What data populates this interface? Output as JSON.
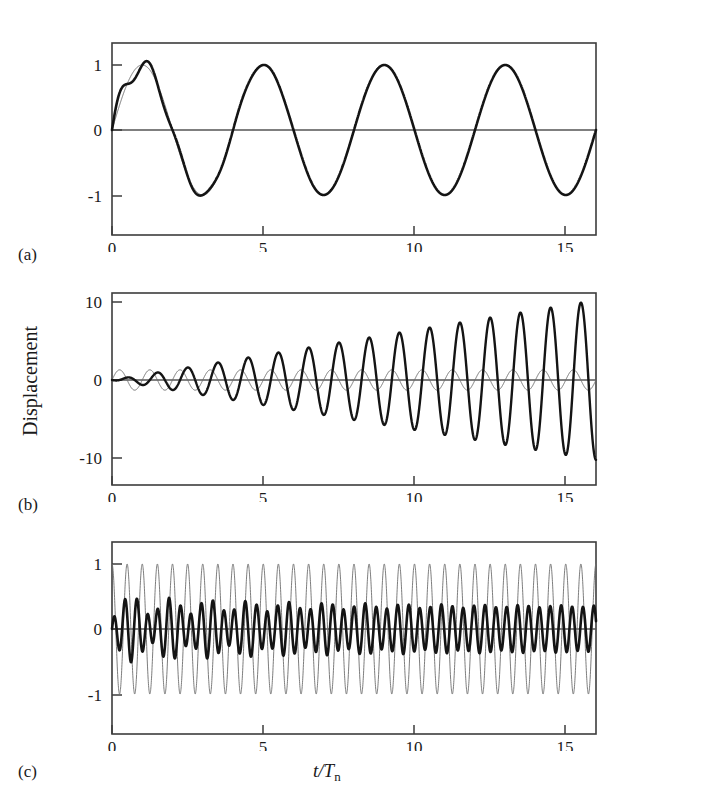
{
  "figure": {
    "ylabel": "Displacement",
    "xlabel_main": "t/T",
    "xlabel_sub": "n",
    "background": "#ffffff",
    "thick_color": "#141414",
    "thin_color": "#6e6e6e",
    "frame_color": "#3c3c3c"
  },
  "panels": [
    {
      "tag": "(a)",
      "x_ticks": [
        "0",
        "5",
        "10",
        "15"
      ],
      "y_ticks": [
        "1",
        "0",
        "-1"
      ]
    },
    {
      "tag": "(b)",
      "x_ticks": [
        "0",
        "5",
        "10",
        "15"
      ],
      "y_ticks": [
        "10",
        "0",
        "-10"
      ]
    },
    {
      "tag": "(c)",
      "x_ticks": [
        "0",
        "5",
        "10",
        "15"
      ],
      "y_ticks": [
        "1",
        "0",
        "-1"
      ]
    }
  ],
  "chart_data": [
    {
      "type": "line",
      "title": "(a) Response for forcing frequency well below natural frequency",
      "xlabel": "t/T_n",
      "ylabel": "Displacement",
      "xlim": [
        0,
        16
      ],
      "ylim": [
        -1.35,
        1.35
      ],
      "xticks": [
        0,
        5,
        10,
        15
      ],
      "yticks": [
        -1,
        0,
        1
      ],
      "grid": false,
      "legend": "none",
      "series": [
        {
          "name": "total response (thick)",
          "style": "thick-black",
          "model": "steady_plus_transient",
          "amplitude": 1.0,
          "forcing_period": 4.0,
          "transient_period": 1.0,
          "transient_amplitude": 0.22,
          "transient_decay_time": 1.6,
          "description": "Forced sinusoid of amplitude ~1 and period 4 t/Tn, with a decaying transient ripple at the natural period visible only during the first ~2 t/Tn; first peak overshoots to ~1.2."
        },
        {
          "name": "steady-state response (thin)",
          "style": "thin-gray",
          "model": "pure_sine",
          "amplitude": 1.0,
          "period": 4.0,
          "phase": 0.0,
          "description": "Smooth sinusoid, amplitude 1.0, period 4 t/Tn, zero at t=0 rising."
        }
      ],
      "annotations": [
        "peaks near t/Tn = 1, 5, 9, 13",
        "troughs near t/Tn = 3, 7, 11, 15"
      ]
    },
    {
      "type": "line",
      "title": "(b) Resonance: forcing frequency equals natural frequency",
      "xlabel": "t/T_n",
      "ylabel": "Displacement",
      "xlim": [
        0,
        16
      ],
      "ylim": [
        -13,
        13
      ],
      "xticks": [
        0,
        5,
        10,
        15
      ],
      "yticks": [
        -10,
        0,
        10
      ],
      "grid": false,
      "legend": "none",
      "series": [
        {
          "name": "resonant response (thick)",
          "style": "thick-black",
          "model": "linear_growing_envelope",
          "period": 1.0,
          "envelope_slope_per_unit": 0.64,
          "envelope_at_t16": 10.3,
          "description": "Oscillation at period 1 t/Tn whose amplitude grows almost linearly from 0 to about 10 at t/Tn = 16."
        },
        {
          "name": "forcing / static response (thin)",
          "style": "thin-gray",
          "model": "pure_sine",
          "amplitude": 1.3,
          "period": 1.0,
          "phase": 0.0,
          "description": "Small constant-amplitude sinusoid of amplitude ~1.3, period 1 t/Tn, in quadrature with the growing response."
        }
      ],
      "annotations": [
        "envelope reaches +10 and -10 near the right edge"
      ]
    },
    {
      "type": "line",
      "title": "(c) Response for forcing frequency well above natural frequency",
      "xlabel": "t/T_n",
      "ylabel": "Displacement",
      "xlim": [
        0,
        16
      ],
      "ylim": [
        -1.35,
        1.35
      ],
      "xticks": [
        0,
        5,
        10,
        15
      ],
      "yticks": [
        -1,
        0,
        1
      ],
      "grid": false,
      "legend": "none",
      "series": [
        {
          "name": "transient at natural frequency (thin)",
          "style": "thin-gray",
          "model": "pure_sine",
          "amplitude": 1.0,
          "period": 0.5,
          "phase": 1.5707963,
          "description": "Constant-amplitude high-frequency sinusoid, amplitude 1.0, period about 0.5 t/Tn, starting near +1 at t=0."
        },
        {
          "name": "total response (thick)",
          "style": "thick-black",
          "model": "two_tone_beat",
          "amplitude_primary": 0.35,
          "period_primary": 0.36,
          "amplitude_secondary": 0.18,
          "period_secondary": 0.5,
          "beat_period": 1.2,
          "description": "Small-amplitude response (about 0.35 peak) at the high forcing frequency superposed with the natural-frequency transient, producing a visible beat pattern larger at early times and settling near 0.35."
        }
      ],
      "annotations": [
        "thick trace amplitude ~0.35, thin trace amplitude ~1.0"
      ]
    }
  ]
}
